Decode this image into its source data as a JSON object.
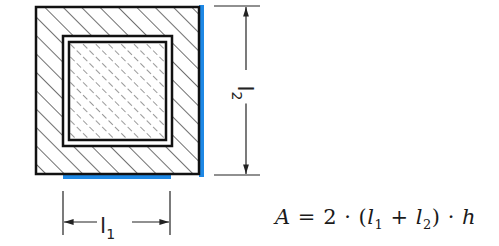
{
  "diagram": {
    "colors": {
      "outline": "#111111",
      "hatch": "#222222",
      "highlight": "#1e88e5",
      "background": "#ffffff"
    },
    "dimensions": {
      "l1": {
        "symbol": "l",
        "subscript": "1"
      },
      "l2": {
        "symbol": "l",
        "subscript": "2"
      }
    },
    "formula": {
      "lhs": "A",
      "equals": "=",
      "factor": "2",
      "dot": "·",
      "open_paren": "(",
      "term1": {
        "symbol": "l",
        "subscript": "1"
      },
      "plus": "+",
      "term2": {
        "symbol": "l",
        "subscript": "2"
      },
      "close_paren": ")",
      "last_var": "h"
    }
  }
}
